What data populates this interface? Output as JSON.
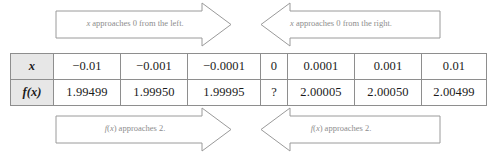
{
  "figure": {
    "type": "limit-table",
    "top_arrows": {
      "left": {
        "text": "x approaches 0 from the left.",
        "direction": "right",
        "italic_var": "x"
      },
      "right": {
        "text": "x approaches 0 from the right.",
        "direction": "left",
        "italic_var": "x"
      }
    },
    "bottom_arrows": {
      "left": {
        "text": "f(x) approaches 2.",
        "direction": "right",
        "italic_var": "f(x)"
      },
      "right": {
        "text": "f(x) approaches 2.",
        "direction": "left",
        "italic_var": "f(x)"
      }
    }
  },
  "table": {
    "row_labels": {
      "x": "x",
      "fx": "f(x)"
    },
    "x_values": [
      "−0.01",
      "−0.001",
      "−0.0001",
      "0",
      "0.0001",
      "0.001",
      "0.01"
    ],
    "fx_values": [
      "1.99499",
      "1.99950",
      "1.99995",
      "?",
      "2.00005",
      "2.00050",
      "2.00499"
    ]
  },
  "chart_data": {
    "type": "table",
    "title": "",
    "categories": [
      "-0.01",
      "-0.001",
      "-0.0001",
      "0",
      "0.0001",
      "0.001",
      "0.01"
    ],
    "series": [
      {
        "name": "f(x)",
        "values": [
          1.99499,
          1.9995,
          1.99995,
          null,
          2.00005,
          2.0005,
          2.00499
        ]
      }
    ],
    "xlabel": "x",
    "ylabel": "f(x)",
    "annotations": [
      "x approaches 0 from the left.",
      "x approaches 0 from the right.",
      "f(x) approaches 2.",
      "f(x) approaches 2."
    ],
    "grid": false,
    "legend": "none"
  },
  "colors": {
    "border": "#8e8e8e",
    "rowhead_bg": "#e7e7e7",
    "arrow_stroke": "#9a9a9a",
    "arrow_fill": "#ffffff",
    "arrow_text": "#8d8d8d",
    "cell_text": "#1b1b1b"
  }
}
